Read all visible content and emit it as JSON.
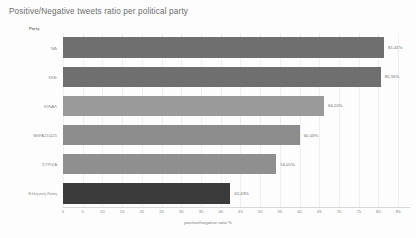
{
  "chart_data": {
    "type": "bar",
    "orientation": "horizontal",
    "title": "Positive/Negative tweets ratio per political party",
    "xlabel": "positive/negative ratio %",
    "ylabel": "Party",
    "xlim": [
      0,
      88
    ],
    "xticks": [
      0,
      5,
      10,
      15,
      20,
      25,
      30,
      35,
      40,
      45,
      50,
      55,
      60,
      65,
      70,
      75,
      80,
      85
    ],
    "grid": true,
    "legend": "none",
    "categories": [
      "ΝΔ",
      "ΚΚΕ",
      "ΚΙΝΑΛ",
      "ΜέΡΑ21Ω25",
      "ΣΥΡΙΖΑ",
      "Ελληνική Λύση"
    ],
    "values": [
      81.41,
      80.56,
      66.2,
      60.03,
      54.05,
      42.43
    ],
    "value_labels": [
      "81,41%",
      "80,56%",
      "66,20%",
      "60,03%",
      "54,05%",
      "42,43%"
    ],
    "bar_colors": [
      "#6f6f6f",
      "#6f6f6f",
      "#9a9a9a",
      "#8c8c8c",
      "#8f8f8f",
      "#3b3b3b"
    ]
  }
}
